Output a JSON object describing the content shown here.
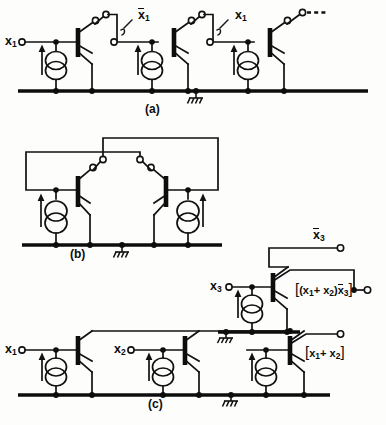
{
  "figure": {
    "kind": "circuit-schematic",
    "parts": [
      {
        "id": "a",
        "label": "(a)",
        "caption_x": 152,
        "caption_y": 100
      },
      {
        "id": "b",
        "label": "(b)",
        "caption_x": 78,
        "caption_y": 255
      },
      {
        "id": "c",
        "label": "(c)",
        "caption_x": 155,
        "caption_y": 402
      }
    ]
  },
  "labels": {
    "part_a": {
      "input_x1": {
        "text": "x",
        "sub": "1",
        "overbar": false
      },
      "node_x1_bar": {
        "text": "x",
        "sub": "1",
        "overbar": true
      },
      "node_x1": {
        "text": "x",
        "sub": "1",
        "overbar": false
      },
      "continuation": "- - -"
    },
    "part_c": {
      "input_x1": {
        "text": "x",
        "sub": "1",
        "overbar": false
      },
      "input_x2": {
        "text": "x",
        "sub": "2",
        "overbar": false
      },
      "input_x3": {
        "text": "x",
        "sub": "3",
        "overbar": false
      },
      "output_x3_bar": {
        "text": "x",
        "sub": "3",
        "overbar": true
      },
      "output_and": "[(x1+ x2)x3]",
      "output_or": "[x1+ x2]"
    }
  },
  "symbols": {
    "current_source": "current-source-double-circle-with-arrow",
    "transistor": "multi-emitter-bipolar-transistor",
    "ground": "hatched-ground",
    "terminal": "open-circle-terminal",
    "junction": "filled-dot-junction"
  },
  "colors": {
    "ink": "#111111",
    "paper": "#fdfdfc",
    "rail": "#0d0d0d"
  },
  "logic": {
    "part_a_function": "inverter-chain / x1 and x1-bar taps",
    "part_b_function": "cross-coupled latch (flip-flop)",
    "part_c_function": "OR of x1,x2 then AND with x3-bar"
  }
}
